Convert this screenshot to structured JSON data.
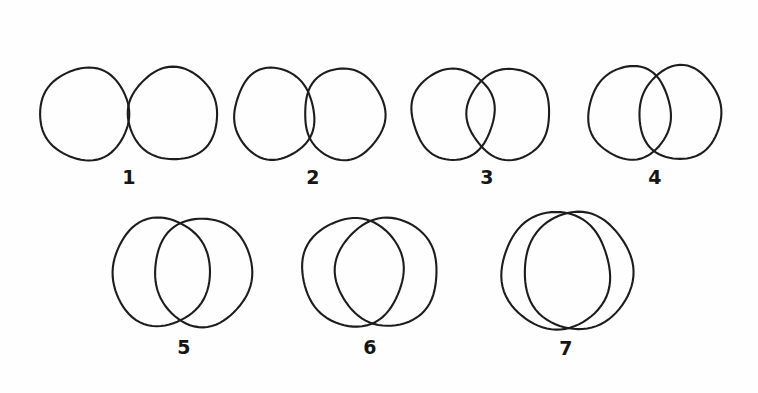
{
  "figure": {
    "background_color": "#fefefe",
    "stroke_color": "#1d1d1d",
    "caption_color": "#151515",
    "width": 758,
    "height": 393
  },
  "chart_data": {
    "type": "diagram",
    "title": "",
    "xlabel": "",
    "ylabel": "",
    "rows": [
      {
        "row_index": 1,
        "items": [
          "1",
          "2",
          "3",
          "4"
        ]
      },
      {
        "row_index": 2,
        "items": [
          "5",
          "6",
          "7"
        ]
      }
    ],
    "items": [
      {
        "label": "1",
        "label_x": 129,
        "label_y": 184,
        "row": 1,
        "overlap_px": 0,
        "center_distance_px": 88,
        "circles": [
          {
            "cx": 85,
            "cy": 114,
            "rx": 45,
            "ry": 46
          },
          {
            "cx": 173,
            "cy": 114,
            "rx": 45,
            "ry": 46
          }
        ]
      },
      {
        "label": "2",
        "label_x": 313,
        "label_y": 184,
        "row": 1,
        "overlap_px": 9,
        "center_distance_px": 70,
        "circles": [
          {
            "cx": 274,
            "cy": 114,
            "rx": 40,
            "ry": 46
          },
          {
            "cx": 344,
            "cy": 114,
            "rx": 40,
            "ry": 46
          }
        ]
      },
      {
        "label": "3",
        "label_x": 487,
        "label_y": 184,
        "row": 1,
        "overlap_px": 25,
        "center_distance_px": 56,
        "circles": [
          {
            "cx": 453,
            "cy": 114,
            "rx": 41,
            "ry": 46
          },
          {
            "cx": 509,
            "cy": 114,
            "rx": 41,
            "ry": 46
          }
        ]
      },
      {
        "label": "4",
        "label_x": 655,
        "label_y": 184,
        "row": 1,
        "overlap_px": 32,
        "center_distance_px": 50,
        "circles": [
          {
            "cx": 630,
            "cy": 113,
            "rx": 41,
            "ry": 47
          },
          {
            "cx": 680,
            "cy": 113,
            "rx": 41,
            "ry": 47
          }
        ]
      },
      {
        "label": "5",
        "label_x": 184,
        "label_y": 354,
        "row": 2,
        "overlap_px": 40,
        "center_distance_px": 42,
        "circles": [
          {
            "cx": 161,
            "cy": 272,
            "rx": 49,
            "ry": 54
          },
          {
            "cx": 203,
            "cy": 272,
            "rx": 49,
            "ry": 54
          }
        ]
      },
      {
        "label": "6",
        "label_x": 370,
        "label_y": 354,
        "row": 2,
        "overlap_px": 50,
        "center_distance_px": 34,
        "circles": [
          {
            "cx": 353,
            "cy": 272,
            "rx": 51,
            "ry": 54
          },
          {
            "cx": 387,
            "cy": 272,
            "rx": 51,
            "ry": 54
          }
        ]
      },
      {
        "label": "7",
        "label_x": 566,
        "label_y": 355,
        "row": 2,
        "overlap_px": 78,
        "center_distance_px": 22,
        "circles": [
          {
            "cx": 556,
            "cy": 271,
            "rx": 54,
            "ry": 59
          },
          {
            "cx": 578,
            "cy": 271,
            "rx": 54,
            "ry": 59
          }
        ]
      }
    ]
  }
}
